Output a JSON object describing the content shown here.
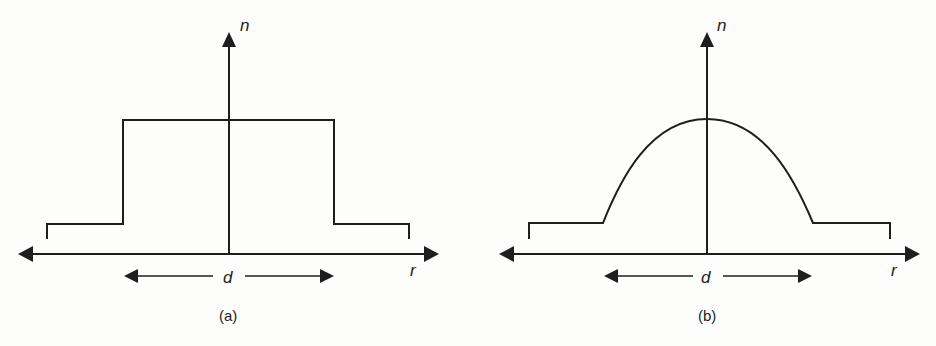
{
  "figure": {
    "panels": [
      {
        "id": "a",
        "caption": "(a)",
        "profile": "step-index",
        "y_axis_label": "n",
        "x_axis_label": "r",
        "dimension_label": "d"
      },
      {
        "id": "b",
        "caption": "(b)",
        "profile": "graded-index",
        "y_axis_label": "n",
        "x_axis_label": "r",
        "dimension_label": "d"
      }
    ]
  },
  "colors": {
    "line": "#1e1e1e",
    "background": "#fdfdfb"
  }
}
